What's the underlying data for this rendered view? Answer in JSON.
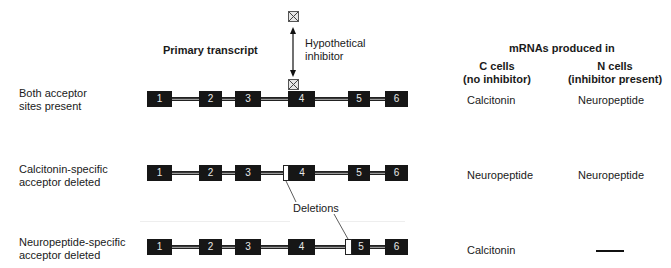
{
  "title": "Primary transcript",
  "inhibitor_label": [
    "Hypothetical",
    "inhibitor"
  ],
  "results_header": {
    "title": "mRNAs produced in",
    "c_cells": [
      "C cells",
      "(no inhibitor)"
    ],
    "n_cells": [
      "N cells",
      "(inhibitor present)"
    ]
  },
  "deletions_label": "Deletions",
  "exon_labels": [
    "1",
    "2",
    "3",
    "4",
    "5",
    "6"
  ],
  "rows": [
    {
      "condition": [
        "Both acceptor",
        "sites present"
      ],
      "c_cells": "Calcitonin",
      "n_cells": "Neuropeptide"
    },
    {
      "condition": [
        "Calcitonin-specific",
        "acceptor deleted"
      ],
      "c_cells": "Neuropeptide",
      "n_cells": "Neuropeptide"
    },
    {
      "condition": [
        "Neuropeptide-specific",
        "acceptor deleted"
      ],
      "c_cells": "Calcitonin",
      "n_cells": "—"
    }
  ]
}
